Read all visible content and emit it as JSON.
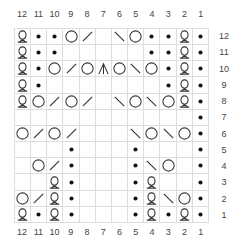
{
  "chart": {
    "column_labels": [
      "12",
      "11",
      "10",
      "9",
      "8",
      "7",
      "6",
      "5",
      "4",
      "3",
      "2",
      "1"
    ],
    "row_labels": [
      "12",
      "11",
      "10",
      "9",
      "8",
      "7",
      "6",
      "5",
      "4",
      "3",
      "2",
      "1"
    ],
    "legend_symbols": {
      "Q": "twisted-knit-icon",
      "•": "purl-icon",
      "O": "yarn-over-icon",
      "/": "k2tog-icon",
      "\\": "ssk-icon",
      "A": "double-decrease-icon",
      "": "knit-icon"
    },
    "rows": [
      {
        "row": "12",
        "cells": [
          "Q",
          "•",
          "•",
          "O",
          "/",
          "",
          "\\",
          "O",
          "•",
          "•",
          "Q",
          "•"
        ]
      },
      {
        "row": "11",
        "cells": [
          "Q",
          "•",
          "•",
          "",
          "",
          "",
          "",
          "",
          "•",
          "•",
          "Q",
          "•"
        ]
      },
      {
        "row": "10",
        "cells": [
          "Q",
          "•",
          "O",
          "/",
          "O",
          "A",
          "O",
          "\\",
          "O",
          "•",
          "Q",
          "•"
        ]
      },
      {
        "row": "9",
        "cells": [
          "Q",
          "•",
          "",
          "",
          "",
          "",
          "",
          "",
          "",
          "•",
          "Q",
          "•"
        ]
      },
      {
        "row": "8",
        "cells": [
          "Q",
          "O",
          "/",
          "O",
          "/",
          "",
          "\\",
          "O",
          "\\",
          "O",
          "Q",
          "•"
        ]
      },
      {
        "row": "7",
        "cells": [
          "",
          "",
          "",
          "",
          "",
          "",
          "",
          "",
          "",
          "",
          "",
          "•"
        ]
      },
      {
        "row": "6",
        "cells": [
          "O",
          "/",
          "O",
          "/",
          "",
          "",
          "",
          "\\",
          "O",
          "\\",
          "O",
          "•"
        ]
      },
      {
        "row": "5",
        "cells": [
          "",
          "",
          "",
          "•",
          "",
          "",
          "",
          "•",
          "",
          "",
          "",
          "•"
        ]
      },
      {
        "row": "4",
        "cells": [
          "",
          "O",
          "/",
          "•",
          "",
          "",
          "",
          "•",
          "\\",
          "O",
          "",
          "•"
        ]
      },
      {
        "row": "3",
        "cells": [
          "",
          "",
          "Q",
          "•",
          "",
          "",
          "",
          "•",
          "Q",
          "",
          "",
          "•"
        ]
      },
      {
        "row": "2",
        "cells": [
          "O",
          "/",
          "Q",
          "•",
          "",
          "",
          "",
          "•",
          "Q",
          "\\",
          "O",
          "•"
        ]
      },
      {
        "row": "1",
        "cells": [
          "Q",
          "•",
          "Q",
          "•",
          "",
          "",
          "",
          "•",
          "Q",
          "•",
          "Q",
          "•"
        ]
      }
    ]
  }
}
